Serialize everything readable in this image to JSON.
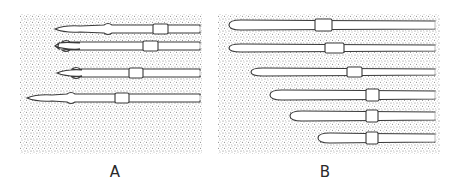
{
  "figure": {
    "background_color": "#ffffff",
    "stipple_color": "#7a7a7a",
    "outline_color": "#3a3a3a",
    "shape_fill": "#ffffff",
    "panels": [
      {
        "id": "A",
        "label": "A",
        "label_x": 100,
        "rect": {
          "x": 20,
          "y": 14,
          "w": 182,
          "h": 140
        },
        "shapes": [
          {
            "y": 29,
            "tip_x": 55,
            "box_x1": 153,
            "box_x2": 168,
            "end_x": 200,
            "half_h": 4,
            "bulge_x": 108,
            "notched": false
          },
          {
            "y": 46,
            "tip_x": 55,
            "box_x1": 143,
            "box_x2": 158,
            "end_x": 200,
            "half_h": 4,
            "bulge_x": 66,
            "notched": true
          },
          {
            "y": 73,
            "tip_x": 57,
            "box_x1": 129,
            "box_x2": 143,
            "end_x": 200,
            "half_h": 4,
            "bulge_x": 76,
            "notched": false
          },
          {
            "y": 98,
            "tip_x": 27,
            "box_x1": 115,
            "box_x2": 129,
            "end_x": 200,
            "half_h": 4,
            "bulge_x": 71,
            "notched": false
          }
        ]
      },
      {
        "id": "B",
        "label": "B",
        "label_x": 310,
        "rect": {
          "x": 218,
          "y": 14,
          "w": 222,
          "h": 140
        },
        "shapes": [
          {
            "y": 25,
            "tip_x": 229,
            "box_x1": 315,
            "box_x2": 332,
            "end_x": 435,
            "half_h": 5
          },
          {
            "y": 48,
            "tip_x": 229,
            "box_x1": 325,
            "box_x2": 344,
            "end_x": 435,
            "half_h": 4
          },
          {
            "y": 72,
            "tip_x": 251,
            "box_x1": 347,
            "box_x2": 362,
            "end_x": 435,
            "half_h": 4
          },
          {
            "y": 95,
            "tip_x": 270,
            "box_x1": 366,
            "box_x2": 379,
            "end_x": 435,
            "half_h": 5
          },
          {
            "y": 116,
            "tip_x": 290,
            "box_x1": 366,
            "box_x2": 378,
            "end_x": 435,
            "half_h": 5
          },
          {
            "y": 138,
            "tip_x": 318,
            "box_x1": 366,
            "box_x2": 378,
            "end_x": 435,
            "half_h": 5
          }
        ]
      }
    ]
  }
}
